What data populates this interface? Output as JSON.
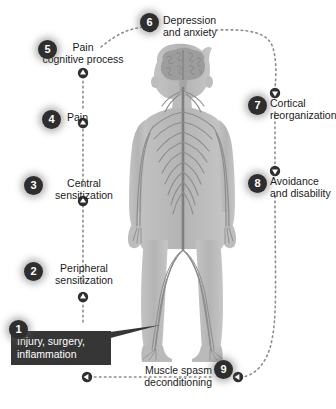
{
  "diagram": {
    "background_color": "#ffffff",
    "node_badge_color": "#2e2e2e",
    "node_badge_text_color": "#ffffff",
    "callout_color": "#363636",
    "connector_color": "#8c8c8c",
    "figure_color": "#b9b9b9",
    "nerve_color": "#8f8f8f",
    "brain_color": "#9a9a9a"
  },
  "nodes": [
    {
      "number": "1",
      "label": "Injury, surgery,\ninflammation",
      "style": "callout"
    },
    {
      "number": "2",
      "label": "Peripheral\nsensitization",
      "style": "plain"
    },
    {
      "number": "3",
      "label": "Central\nsensitization",
      "style": "plain"
    },
    {
      "number": "4",
      "label": "Pain",
      "style": "plain"
    },
    {
      "number": "5",
      "label": "Pain\ncognitive process",
      "style": "plain"
    },
    {
      "number": "6",
      "label": "Depression\nand anxiety",
      "style": "plain"
    },
    {
      "number": "7",
      "label": "Cortical\nreorganization",
      "style": "plain"
    },
    {
      "number": "8",
      "label": "Avoidance\nand disability",
      "style": "plain"
    },
    {
      "number": "9",
      "label": "Muscle spasm\ndeconditioning",
      "style": "plain"
    }
  ],
  "figure": {
    "name": "human-nervous-system-figure"
  }
}
